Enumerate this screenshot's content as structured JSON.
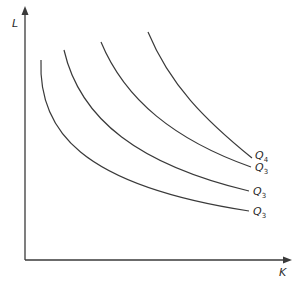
{
  "diagram": {
    "type": "isoquant map",
    "y_axis": {
      "label": "L"
    },
    "x_axis": {
      "label": "K"
    },
    "curves": [
      {
        "id": "curve-1",
        "label": "Q",
        "subscript": "3"
      },
      {
        "id": "curve-2",
        "label": "Q",
        "subscript": "3"
      },
      {
        "id": "curve-3",
        "label": "Q",
        "subscript": "3"
      },
      {
        "id": "curve-4",
        "label": "Q",
        "subscript": "4"
      }
    ],
    "colors": {
      "line": "#3a3a3a",
      "background": "#ffffff"
    }
  }
}
